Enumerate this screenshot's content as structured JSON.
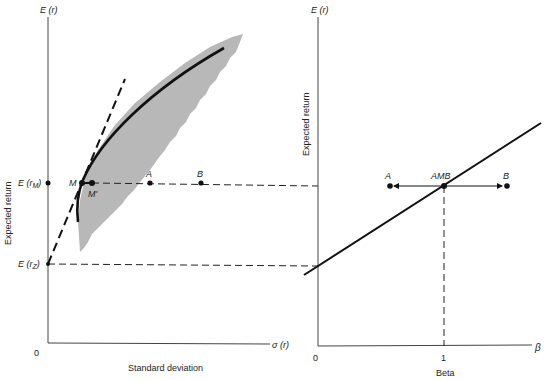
{
  "left_panel": {
    "y_axis_label_top": "E (r)",
    "y_axis_title": "Expected return",
    "x_axis_title": "Standard deviation",
    "x_axis_end_label": "σ (r)",
    "origin_label": "0",
    "tick_rm": "E (r",
    "tick_rm_sub": "M",
    "tick_rz": "E (r",
    "tick_rz_sub": "Z",
    "points": {
      "M": "M",
      "M_prime": "M'",
      "A": "A",
      "B": "B"
    }
  },
  "right_panel": {
    "y_axis_label_top": "E (r)",
    "y_axis_title": "Expected return",
    "x_axis_title": "Beta",
    "x_axis_end_label": "β",
    "origin_label": "0",
    "tick_one": "1",
    "points": {
      "A": "A",
      "AMB": "AMB",
      "B": "B"
    }
  },
  "colors": {
    "ink": "#111111",
    "shade": "#b8b8b8",
    "axis": "#444444"
  }
}
